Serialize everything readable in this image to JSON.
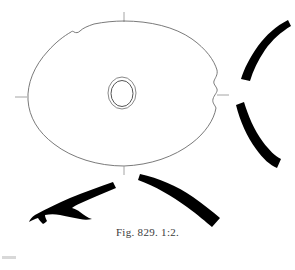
{
  "plate": {
    "caption": "Fig. 829. 1:2.",
    "background_color": "#ffffff",
    "outline_color": "#6b6b6b",
    "fill_color": "#000000",
    "tick_color": "#9a9a9a",
    "artifact_color": "#d8d8d8",
    "width": 295,
    "height": 270
  },
  "objects": {
    "plan_view": {
      "name": "oval disc plan view",
      "center_hole": {
        "name": "central perforation",
        "outer_rx": 14,
        "outer_ry": 16,
        "inner_rx": 11,
        "inner_ry": 13,
        "cx": 122,
        "cy": 93
      }
    },
    "profiles": [
      {
        "name": "upper-right rim profile",
        "position": "upper right"
      },
      {
        "name": "lower-right rim profile",
        "position": "lower right"
      },
      {
        "name": "lower-left section profile",
        "position": "lower left"
      },
      {
        "name": "lower-centre rim profile",
        "position": "lower centre"
      }
    ]
  },
  "axis_ticks": [
    {
      "name": "top axis tick",
      "orientation": "vertical"
    },
    {
      "name": "left axis tick",
      "orientation": "horizontal"
    },
    {
      "name": "right axis tick",
      "orientation": "horizontal"
    },
    {
      "name": "bottom axis tick",
      "orientation": "vertical"
    }
  ]
}
